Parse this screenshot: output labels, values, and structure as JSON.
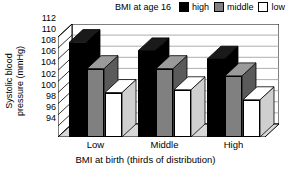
{
  "legend": {
    "title": "BMI at age 16",
    "items": [
      {
        "label": "high",
        "color": "#000000"
      },
      {
        "label": "middle",
        "color": "#808080"
      },
      {
        "label": "low",
        "color": "#ffffff"
      }
    ]
  },
  "axes": {
    "ylabel_line1": "Systolic blood",
    "ylabel_line2": "pressure (mmHg)",
    "xlabel": "BMI at birth (thirds of distribution)",
    "yticks": [
      "94",
      "96",
      "98",
      "100",
      "102",
      "104",
      "106",
      "108",
      "110",
      "112"
    ],
    "xticks": [
      "Low",
      "Middle",
      "High"
    ]
  },
  "chart_data": {
    "type": "bar",
    "title": "",
    "xlabel": "BMI at birth (thirds of distribution)",
    "ylabel": "Systolic blood pressure (mmHg)",
    "ylim": [
      94,
      112
    ],
    "ytick_step": 2,
    "grid": true,
    "legend_position": "top-right",
    "legend_title": "BMI at age 16",
    "style": "3d-clustered-column",
    "categories": [
      "Low",
      "Middle",
      "High"
    ],
    "series": [
      {
        "name": "high",
        "color": "#000000",
        "values": [
          111.0,
          109.5,
          108.0
        ]
      },
      {
        "name": "middle",
        "color": "#808080",
        "values": [
          106.3,
          106.3,
          105.0
        ]
      },
      {
        "name": "low",
        "color": "#ffffff",
        "values": [
          102.0,
          102.5,
          100.7
        ]
      }
    ]
  }
}
